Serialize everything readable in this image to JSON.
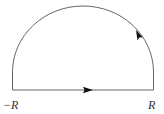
{
  "diagram": {
    "type": "semicircular-contour",
    "labels": {
      "left": "−R",
      "right": "R"
    },
    "arrows": {
      "baseline_direction": "right",
      "arc_direction": "counterclockwise"
    },
    "colors": {
      "stroke": "#555555",
      "arrow": "#111111",
      "label": "#333333"
    }
  }
}
